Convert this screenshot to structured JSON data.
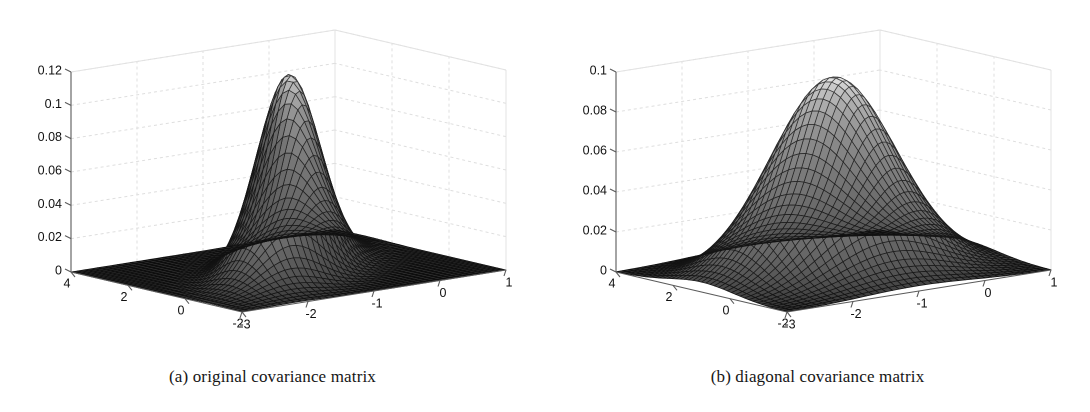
{
  "figure": {
    "background_color": "#ffffff",
    "width": 1090,
    "height": 412,
    "panel_count": 2
  },
  "panels": [
    {
      "id": "a",
      "caption": "(a) original covariance matrix",
      "axis_color": "#555555",
      "grid_color": "#d9d9d9"
    },
    {
      "id": "b",
      "caption": "(b) diagonal covariance matrix",
      "axis_color": "#555555",
      "grid_color": "#d9d9d9"
    }
  ],
  "chart_data": [
    {
      "type": "surface",
      "panel": "a",
      "title": "(a) original covariance matrix",
      "xlabel": "",
      "ylabel": "",
      "zlabel": "",
      "xticks": [
        -3,
        -2,
        -1,
        0,
        1
      ],
      "xticklabels": [
        "-3",
        "-2",
        "-1",
        "0",
        "1"
      ],
      "yticks": [
        -2,
        0,
        2,
        4
      ],
      "yticklabels": [
        "-2",
        "0",
        "2",
        "4"
      ],
      "zticks": [
        0,
        0.02,
        0.04,
        0.06,
        0.08,
        0.1,
        0.12
      ],
      "zticklabels": [
        "0",
        "0.02",
        "0.04",
        "0.06",
        "0.08",
        "0.1",
        "0.12"
      ],
      "xlim": [
        -3,
        1
      ],
      "ylim": [
        -2,
        4
      ],
      "zlim": [
        0,
        0.12
      ],
      "grid": true,
      "colormap": "grayscale",
      "mesh": true,
      "mesh_nx": 41,
      "mesh_ny": 41,
      "description": "Bivariate Gaussian density with full (correlated) covariance: sharp narrow peak, elongated along the correlation direction.",
      "surface_model": {
        "kind": "gaussian2d",
        "peak_value": 0.118,
        "mean_x": -1.0,
        "mean_y": 1.0,
        "sigma_x": 0.62,
        "sigma_y": 0.95,
        "correlation": 0.62
      }
    },
    {
      "type": "surface",
      "panel": "b",
      "title": "(b) diagonal covariance matrix",
      "xlabel": "",
      "ylabel": "",
      "zlabel": "",
      "xticks": [
        -3,
        -2,
        -1,
        0,
        1
      ],
      "xticklabels": [
        "-3",
        "-2",
        "-1",
        "0",
        "1"
      ],
      "yticks": [
        -2,
        0,
        2,
        4
      ],
      "yticklabels": [
        "-2",
        "0",
        "2",
        "4"
      ],
      "zticks": [
        0,
        0.02,
        0.04,
        0.06,
        0.08,
        0.1
      ],
      "zticklabels": [
        "0",
        "0.02",
        "0.04",
        "0.06",
        "0.08",
        "0.1"
      ],
      "xlim": [
        -3,
        1
      ],
      "ylim": [
        -2,
        4
      ],
      "zlim": [
        0,
        0.1
      ],
      "grid": true,
      "colormap": "grayscale",
      "mesh": true,
      "mesh_nx": 41,
      "mesh_ny": 41,
      "description": "Bivariate Gaussian density with diagonal (uncorrelated) covariance: broader, rounder, lower peak.",
      "surface_model": {
        "kind": "gaussian2d",
        "peak_value": 0.097,
        "mean_x": -1.0,
        "mean_y": 1.0,
        "sigma_x": 0.82,
        "sigma_y": 1.12,
        "correlation": 0.0
      }
    }
  ]
}
